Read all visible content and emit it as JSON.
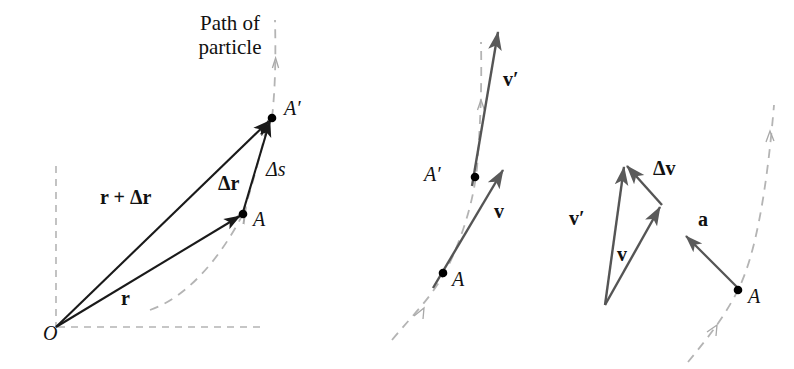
{
  "figure": {
    "title_text": "Path of particle",
    "background_color": "#ffffff",
    "solid_vector_color": "#1a1a1a",
    "gray_vector_color": "#555555",
    "dashed_path_color": "#b0b0b0",
    "point_color": "#000000"
  },
  "panel_position": {
    "name": "position-vectors-panel",
    "caption_line1": "Path of",
    "caption_line2": "particle",
    "labels": {
      "origin": "O",
      "point_a": "A",
      "point_a_prime": "A′",
      "vector_r": "r",
      "vector_r_plus_dr": "r + Δr",
      "vector_delta_r": "Δr",
      "arc_delta_s": "Δs"
    },
    "points": {
      "origin": [
        56,
        327
      ],
      "a": [
        243,
        214
      ],
      "a_prime": [
        272,
        118
      ]
    },
    "axes": {
      "vertical_x": 56,
      "vertical_y_top": 166,
      "vertical_y_bottom": 327,
      "horizontal_y": 327,
      "horizontal_x_left": 58,
      "horizontal_x_right": 263
    }
  },
  "panel_velocity": {
    "name": "velocity-vectors-panel",
    "labels": {
      "point_a": "A",
      "point_a_prime": "A′",
      "vector_v": "v",
      "vector_v_prime": "v′"
    },
    "points": {
      "a": [
        443,
        273
      ],
      "a_prime": [
        475,
        177
      ]
    },
    "vector_tips": {
      "v": [
        505,
        168
      ],
      "v_prime": [
        499,
        30
      ]
    }
  },
  "panel_acceleration": {
    "name": "acceleration-panel",
    "labels": {
      "point_a": "A",
      "vector_v": "v",
      "vector_v_prime": "v′",
      "vector_delta_v": "Δv",
      "vector_a": "a"
    },
    "points": {
      "triangle_origin": [
        605,
        305
      ],
      "v_tip": [
        662,
        205
      ],
      "v_prime_tip": [
        626,
        165
      ],
      "a": [
        738,
        290
      ],
      "a_tip": [
        688,
        238
      ]
    }
  }
}
